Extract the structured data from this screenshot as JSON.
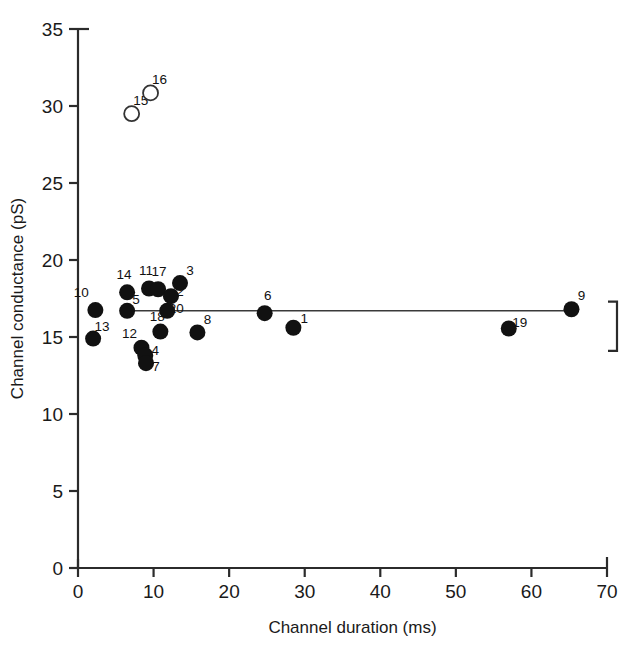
{
  "chart_data": {
    "type": "scatter",
    "title": "",
    "xlabel": "Channel duration (ms)",
    "ylabel": "Channel conductance (pS)",
    "xlim": [
      0,
      70
    ],
    "ylim": [
      0,
      35
    ],
    "xticks": [
      0,
      10,
      20,
      30,
      40,
      50,
      60,
      70
    ],
    "yticks": [
      0,
      5,
      10,
      15,
      20,
      25,
      30,
      35
    ],
    "xtick_labels": [
      "0",
      "10",
      "20",
      "30",
      "40",
      "50",
      "60",
      "70"
    ],
    "ytick_labels": [
      "0",
      "5",
      "10",
      "15",
      "20",
      "25",
      "30",
      "35"
    ],
    "grid": false,
    "legend": false,
    "series": [
      {
        "name": "filled",
        "marker": "filled-circle",
        "color": "#111111",
        "points": [
          {
            "label": "10",
            "x": 2.3,
            "y": 16.75,
            "lx": -14,
            "ly": -13
          },
          {
            "label": "13",
            "x": 2.0,
            "y": 14.9,
            "lx": 9,
            "ly": -8
          },
          {
            "label": "14",
            "x": 6.5,
            "y": 17.9,
            "lx": -3,
            "ly": -13
          },
          {
            "label": "5",
            "x": 6.5,
            "y": 16.7,
            "lx": 9,
            "ly": -7
          },
          {
            "label": "12",
            "x": 8.4,
            "y": 14.3,
            "lx": -12,
            "ly": -10
          },
          {
            "label": "4",
            "x": 8.9,
            "y": 13.8,
            "lx": 10,
            "ly": 0
          },
          {
            "label": "7",
            "x": 9.0,
            "y": 13.3,
            "lx": 10,
            "ly": 8
          },
          {
            "label": "11",
            "x": 9.4,
            "y": 18.15,
            "lx": -3,
            "ly": -13
          },
          {
            "label": "17",
            "x": 10.6,
            "y": 18.1,
            "lx": 1,
            "ly": -13
          },
          {
            "label": "18",
            "x": 10.9,
            "y": 15.35,
            "lx": -3,
            "ly": -11
          },
          {
            "label": "20",
            "x": 11.8,
            "y": 16.7,
            "lx": 9,
            "ly": 2
          },
          {
            "label": "2",
            "x": 12.3,
            "y": 17.65,
            "lx": 9,
            "ly": 0
          },
          {
            "label": "3",
            "x": 13.5,
            "y": 18.5,
            "lx": 10,
            "ly": -8
          },
          {
            "label": "8",
            "x": 15.8,
            "y": 15.3,
            "lx": 10,
            "ly": -8
          },
          {
            "label": "6",
            "x": 24.7,
            "y": 16.55,
            "lx": 3,
            "ly": -13
          },
          {
            "label": "1",
            "x": 28.5,
            "y": 15.6,
            "lx": 11,
            "ly": -5
          },
          {
            "label": "19",
            "x": 57.0,
            "y": 15.55,
            "lx": 11,
            "ly": -2
          },
          {
            "label": "9",
            "x": 65.3,
            "y": 16.8,
            "lx": 10,
            "ly": -9
          }
        ]
      },
      {
        "name": "open",
        "marker": "open-circle",
        "color": "#111111",
        "points": [
          {
            "label": "15",
            "x": 7.1,
            "y": 29.5,
            "lx": 9,
            "ly": -9
          },
          {
            "label": "16",
            "x": 9.6,
            "y": 30.85,
            "lx": 9,
            "ly": -9
          }
        ]
      }
    ],
    "reference_line": {
      "type": "horizontal",
      "y": 16.7,
      "x_from": 5.6,
      "x_to": 65.3
    },
    "annotations": [
      {
        "type": "bracket",
        "side": "right",
        "y_top": 17.3,
        "y_bottom": 14.1
      }
    ]
  }
}
